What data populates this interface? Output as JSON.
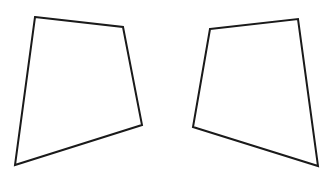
{
  "canvas": {
    "width": 333,
    "height": 180,
    "background": "#ffffff"
  },
  "stroke": {
    "color": "#1a1a1a",
    "width": 2
  },
  "shapes": [
    {
      "name": "left-quadrilateral",
      "points": "35,17 123,27 142,125 15,165"
    },
    {
      "name": "right-quadrilateral",
      "points": "210,29 298,19 318,166 193,127"
    }
  ]
}
